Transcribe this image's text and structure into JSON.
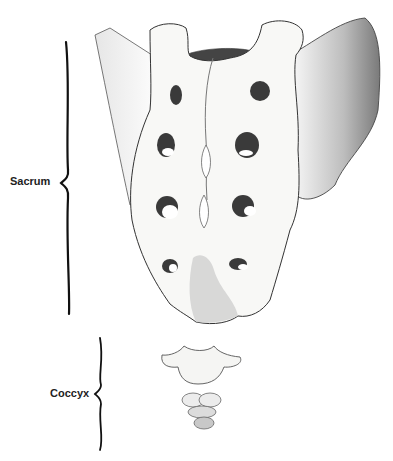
{
  "diagram": {
    "labels": [
      {
        "id": "sacrum",
        "text": "Sacrum"
      },
      {
        "id": "coccyx",
        "text": "Coccyx"
      }
    ],
    "colors": {
      "ink": "#222222",
      "shade": "#555555",
      "bone": "#f7f7f5",
      "hole": "#3a3a3a"
    }
  }
}
